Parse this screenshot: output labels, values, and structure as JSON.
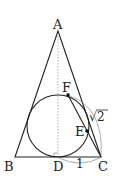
{
  "diagram": {
    "type": "geometry",
    "points": {
      "A": {
        "label": "A",
        "x": 58,
        "y": 31
      },
      "B": {
        "label": "B",
        "x": 15,
        "y": 157
      },
      "C": {
        "label": "C",
        "x": 101,
        "y": 157
      },
      "D": {
        "label": "D",
        "x": 58,
        "y": 157
      },
      "E": {
        "label": "E",
        "x": 87,
        "y": 133
      },
      "F": {
        "label": "F",
        "x": 68,
        "y": 95
      }
    },
    "circle": {
      "cx": 58,
      "cy": 126,
      "r": 31
    },
    "measurements": {
      "DC": "1",
      "EC_label": "√2",
      "sqrt_symbol": "√",
      "sqrt_value": "2"
    },
    "colors": {
      "line": "#222222",
      "dashed": "#999999",
      "arc": "#888888"
    }
  }
}
